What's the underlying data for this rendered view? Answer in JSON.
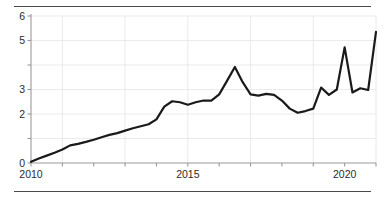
{
  "figure": {
    "rule_top": "horizontal-rule",
    "rule_bottom": "horizontal-rule"
  },
  "chart_data": {
    "type": "line",
    "title": "",
    "subtitle": "",
    "xlabel": "",
    "ylabel": "",
    "xlim": [
      2010.0,
      2021.0
    ],
    "ylim": [
      0,
      6
    ],
    "grid": true,
    "grid_color": "#e6e6e6",
    "legend": "none",
    "line_color": "#1a1a1a",
    "line_width": 2.2,
    "axis_color": "#9a9a9a",
    "y_ticks": [
      0,
      1,
      2,
      3,
      4,
      5,
      6
    ],
    "y_tick_labels": [
      "0",
      "",
      "2",
      "3",
      "",
      "5",
      "6"
    ],
    "y_tick_labels_all": [
      "0",
      "1",
      "2",
      "3",
      "4",
      "5",
      "6"
    ],
    "x_ticks": [
      2010,
      2011,
      2012,
      2013,
      2014,
      2015,
      2016,
      2017,
      2018,
      2019,
      2020,
      2021
    ],
    "x_tick_labels": [
      "2010",
      "",
      "",
      "",
      "",
      "2015",
      "",
      "",
      "",
      "",
      "2020",
      ""
    ],
    "x_major_labels": [
      "2010",
      "2015",
      "2020"
    ],
    "series": [
      {
        "name": "series-1",
        "x": [
          2010.0,
          2010.25,
          2010.5,
          2010.75,
          2011.0,
          2011.25,
          2011.5,
          2011.75,
          2012.0,
          2012.25,
          2012.5,
          2012.75,
          2013.0,
          2013.25,
          2013.5,
          2013.75,
          2014.0,
          2014.25,
          2014.5,
          2014.75,
          2015.0,
          2015.25,
          2015.5,
          2015.75,
          2016.0,
          2016.25,
          2016.5,
          2016.75,
          2017.0,
          2017.25,
          2017.5,
          2017.75,
          2018.0,
          2018.25,
          2018.5,
          2018.75,
          2019.0,
          2019.25,
          2019.5,
          2019.75,
          2020.0,
          2020.25,
          2020.5,
          2020.75,
          2021.0
        ],
        "values": [
          0.05,
          0.18,
          0.3,
          0.42,
          0.55,
          0.72,
          0.78,
          0.86,
          0.95,
          1.05,
          1.15,
          1.22,
          1.32,
          1.42,
          1.5,
          1.58,
          1.78,
          2.3,
          2.52,
          2.48,
          2.38,
          2.48,
          2.55,
          2.55,
          2.8,
          3.35,
          3.92,
          3.3,
          2.8,
          2.75,
          2.82,
          2.78,
          2.55,
          2.22,
          2.05,
          2.12,
          2.22,
          3.08,
          2.78,
          3.0,
          4.72,
          2.88,
          3.05,
          2.98,
          5.35
        ]
      }
    ],
    "note": "Quarterly-style series rising from 0 in 2010 to about 5.4 by 2020, with a peak near 3.9 in late 2015, a trough near 2.0 in 2017, a sharp spike near 4.7 in 2018, and a steep climb to the 2020 maximum."
  }
}
